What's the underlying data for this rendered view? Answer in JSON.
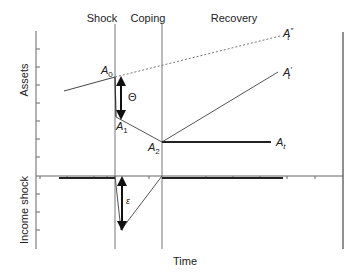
{
  "diagram": {
    "phases": {
      "shock": "Shock",
      "coping": "Coping",
      "recovery": "Recovery"
    },
    "axes": {
      "top_ylabel": "Assets",
      "bottom_ylabel": "Income shock",
      "xlabel": "Time"
    },
    "points": {
      "a0": "A",
      "a0_sub": "0",
      "a1": "A",
      "a1_sub": "1",
      "a2": "A",
      "a2_sub": "2",
      "at": "A",
      "at_sub": "t",
      "at_prime": "A",
      "at_prime_sup": "′",
      "at_prime_sub": "t",
      "at_dprime": "A",
      "at_dprime_sup": "″",
      "at_dprime_sub": "t"
    },
    "annotations": {
      "asset_loss": "Θ",
      "income_shock": "ε"
    },
    "colors": {
      "line": "#555555",
      "thick": "#222222",
      "axis": "#666666"
    }
  }
}
